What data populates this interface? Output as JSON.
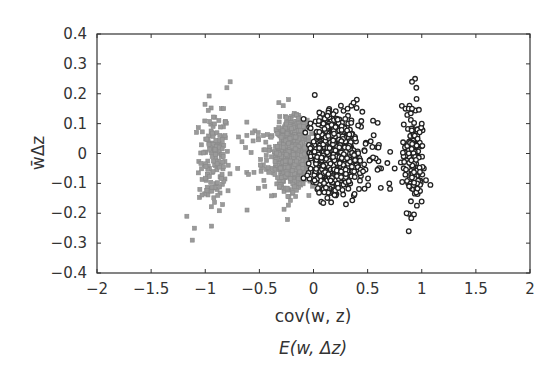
{
  "chart_data": {
    "type": "scatter",
    "title": "",
    "xlabel": "cov(w, z)",
    "xlabel2": "E(w, Δz)",
    "ylabel": "w̄Δz",
    "xlim": [
      -2,
      2
    ],
    "ylim": [
      -0.4,
      0.4
    ],
    "grid": false,
    "legend": null,
    "x_ticks": [
      -2,
      -1.5,
      -1,
      -0.5,
      0,
      0.5,
      1,
      1.5,
      2
    ],
    "x_tick_labels": [
      "−2",
      "−1.5",
      "−1",
      "−0.5",
      "0",
      "0.5",
      "1",
      "1.5",
      "2"
    ],
    "y_ticks": [
      0.4,
      0.3,
      0.2,
      0.1,
      0,
      -0.1,
      -0.2,
      -0.3,
      -0.4
    ],
    "y_tick_labels": [
      "0.4",
      "0.3",
      "0.2",
      "0.1",
      "0",
      "−0.1",
      "−0.2",
      "−0.3",
      "−0.4"
    ],
    "series": [
      {
        "name": "cov(w, z)",
        "marker": "square",
        "color": "#9a9a9a",
        "edge_color": "#8a8a8a",
        "clusters": [
          {
            "cx": -0.92,
            "cy": -0.02,
            "sx": 0.07,
            "sy": 0.085,
            "n": 150
          },
          {
            "cx": -0.2,
            "cy": 0.0,
            "sx": 0.07,
            "sy": 0.055,
            "n": 900
          },
          {
            "cx": -0.45,
            "cy": -0.02,
            "sx": 0.12,
            "sy": 0.06,
            "n": 45
          }
        ],
        "outliers": [
          [
            -1.17,
            -0.21
          ],
          [
            -1.1,
            -0.25
          ],
          [
            -1.12,
            -0.29
          ],
          [
            -0.77,
            0.24
          ],
          [
            -0.8,
            0.22
          ],
          [
            -0.32,
            0.17
          ],
          [
            -0.28,
            0.16
          ],
          [
            -0.7,
            -0.05
          ],
          [
            -0.6,
            -0.07
          ],
          [
            -0.45,
            -0.11
          ],
          [
            -0.85,
            0.15
          ],
          [
            -0.83,
            0.15
          ],
          [
            -1.05,
            -0.12
          ]
        ]
      },
      {
        "name": "E(w, Δz)",
        "marker": "circle",
        "color": "#111111",
        "edge_color": "#222222",
        "clusters": [
          {
            "cx": 0.18,
            "cy": 0.0,
            "sx": 0.085,
            "sy": 0.055,
            "n": 1100
          },
          {
            "cx": 0.92,
            "cy": -0.02,
            "sx": 0.05,
            "sy": 0.085,
            "n": 150
          },
          {
            "cx": 0.42,
            "cy": 0.0,
            "sx": 0.12,
            "sy": 0.07,
            "n": 70
          }
        ],
        "outliers": [
          [
            0.91,
            0.24
          ],
          [
            0.95,
            0.22
          ],
          [
            0.4,
            0.18
          ],
          [
            0.35,
            0.16
          ],
          [
            0.37,
            0.17
          ],
          [
            0.88,
            -0.26
          ],
          [
            0.86,
            -0.2
          ],
          [
            0.9,
            -0.16
          ],
          [
            0.3,
            -0.17
          ],
          [
            0.1,
            -0.13
          ],
          [
            0.55,
            0.11
          ],
          [
            0.6,
            0.02
          ],
          [
            0.85,
            0.15
          ],
          [
            0.88,
            0.15
          ],
          [
            0.91,
            0.15
          ],
          [
            1.0,
            0.1
          ],
          [
            0.75,
            -0.05
          ],
          [
            0.7,
            -0.1
          ]
        ]
      }
    ]
  }
}
